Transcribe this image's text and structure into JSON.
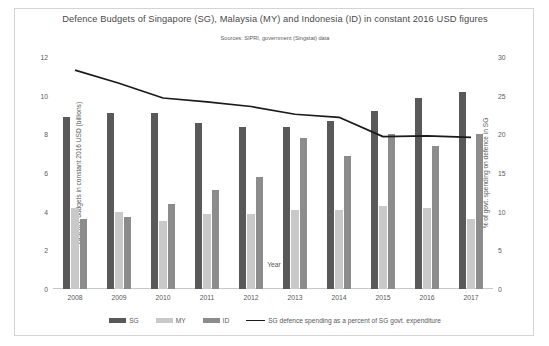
{
  "chart_data": {
    "type": "bar",
    "title": "Defence Budgets of Singapore (SG), Malaysia (MY) and Indonesia (ID) in constant 2016 USD figures",
    "subtitle": "Sources: SIPRI, government (Singstat) data",
    "xlabel": "Year",
    "ylabel": "Defence budgets in constant 2016 USD (billions)",
    "ylabel_secondary": "% of govt. spending on defence in SG",
    "categories": [
      "2008",
      "2009",
      "2010",
      "2011",
      "2012",
      "2013",
      "2014",
      "2015",
      "2016",
      "2017"
    ],
    "ylim": [
      0,
      12
    ],
    "yticks": [
      "0",
      "2",
      "4",
      "6",
      "8",
      "10",
      "12"
    ],
    "ylim_secondary": [
      0,
      30
    ],
    "yticks_secondary": [
      "0",
      "5",
      "10",
      "15",
      "20",
      "25",
      "30"
    ],
    "grid": false,
    "legend_position": "bottom",
    "series": [
      {
        "name": "SG",
        "kind": "bar",
        "axis": "left",
        "color": "#595959",
        "values": [
          8.9,
          9.1,
          9.1,
          8.6,
          8.4,
          8.4,
          8.7,
          9.2,
          9.9,
          10.2
        ]
      },
      {
        "name": "MY",
        "kind": "bar",
        "axis": "left",
        "color": "#c9c9c9",
        "values": [
          4.2,
          4.0,
          3.5,
          3.9,
          3.9,
          4.1,
          4.1,
          4.3,
          4.2,
          3.6
        ]
      },
      {
        "name": "ID",
        "kind": "bar",
        "axis": "left",
        "color": "#8c8c8c",
        "values": [
          3.6,
          3.7,
          4.4,
          5.1,
          5.8,
          7.8,
          6.9,
          8.0,
          7.4,
          8.0
        ]
      },
      {
        "name": "SG defence spending as a percent of SG govt. expenditure",
        "kind": "line",
        "axis": "right",
        "color": "#1a1a1a",
        "values": [
          28.3,
          26.6,
          24.7,
          24.2,
          23.6,
          22.6,
          22.2,
          19.7,
          19.8,
          19.6
        ]
      }
    ]
  },
  "legend": {
    "items": [
      {
        "label": "SG",
        "color": "#595959",
        "marker": "swatch"
      },
      {
        "label": "MY",
        "color": "#c9c9c9",
        "marker": "swatch"
      },
      {
        "label": "ID",
        "color": "#8c8c8c",
        "marker": "swatch"
      },
      {
        "label": "SG defence spending as a percent of SG govt. expenditure",
        "color": "#1a1a1a",
        "marker": "line"
      }
    ]
  }
}
